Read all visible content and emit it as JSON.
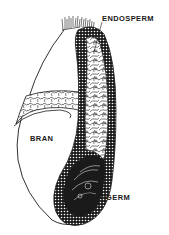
{
  "diagram": {
    "labels": {
      "endosperm": "ENDOSPERM",
      "bran": "BRAN",
      "germ": "GERM"
    },
    "colors": {
      "ink": "#1a1a1a",
      "background": "#ffffff"
    }
  }
}
